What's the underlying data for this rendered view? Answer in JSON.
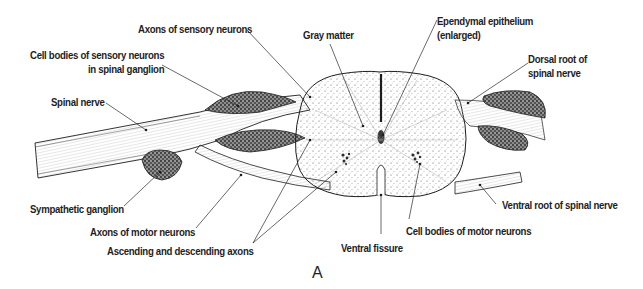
{
  "figure": {
    "panel_letter": "A",
    "colors": {
      "ink": "#1e1e1e",
      "stipple": "#555555",
      "ganglion_fill": "#6a6a6a",
      "background": "#ffffff"
    }
  },
  "labels": [
    {
      "id": "axons-sensory",
      "lines": [
        "Axons of sensory neurons"
      ],
      "x": 138,
      "y": 22,
      "align": "left",
      "leader": [
        [
          247,
          30
        ],
        [
          310,
          97
        ]
      ]
    },
    {
      "id": "cell-bodies-sensory",
      "lines": [
        "Cell bodies of sensory neurons",
        "in spinal ganglion"
      ],
      "x": 30,
      "y": 48,
      "align": "left",
      "leader": [
        [
          162,
          65
        ],
        [
          238,
          106
        ]
      ]
    },
    {
      "id": "spinal-nerve",
      "lines": [
        "Spinal nerve"
      ],
      "x": 51,
      "y": 95,
      "align": "left",
      "leader": [
        [
          106,
          103
        ],
        [
          146,
          130
        ]
      ]
    },
    {
      "id": "gray-matter",
      "lines": [
        "Gray matter"
      ],
      "x": 303,
      "y": 28,
      "align": "left",
      "leader": [
        [
          330,
          44
        ],
        [
          363,
          126
        ]
      ]
    },
    {
      "id": "ependymal-epithelium",
      "lines": [
        "Ependymal epithelium",
        "(enlarged)"
      ],
      "x": 437,
      "y": 14,
      "align": "left",
      "leader": [
        [
          437,
          20
        ],
        [
          383,
          135
        ]
      ]
    },
    {
      "id": "dorsal-root",
      "lines": [
        "Dorsal root of",
        "spinal nerve"
      ],
      "x": 528,
      "y": 52,
      "align": "left",
      "leader": [
        [
          528,
          63
        ],
        [
          468,
          103
        ]
      ]
    },
    {
      "id": "sympathetic-ganglion",
      "lines": [
        "Sympathetic ganglion"
      ],
      "x": 30,
      "y": 202,
      "align": "left",
      "leader": [
        [
          124,
          206
        ],
        [
          160,
          172
        ]
      ]
    },
    {
      "id": "axons-motor",
      "lines": [
        "Axons of motor neurons"
      ],
      "x": 90,
      "y": 225,
      "align": "left",
      "leader": [
        [
          196,
          228
        ],
        [
          241,
          175
        ]
      ]
    },
    {
      "id": "ascending-descending",
      "lines": [
        "Ascending and descending axons"
      ],
      "x": 107,
      "y": 244,
      "align": "left",
      "leaders": [
        [
          [
            253,
            243
          ],
          [
            310,
            140
          ]
        ],
        [
          [
            253,
            243
          ],
          [
            336,
            172
          ]
        ]
      ]
    },
    {
      "id": "ventral-fissure",
      "lines": [
        "Ventral fissure"
      ],
      "x": 341,
      "y": 241,
      "align": "left",
      "leader": [
        [
          381,
          234
        ],
        [
          381,
          195
        ]
      ]
    },
    {
      "id": "cell-bodies-motor",
      "lines": [
        "Cell bodies of motor neurons"
      ],
      "x": 406,
      "y": 224,
      "align": "left",
      "leader": [
        [
          409,
          219
        ],
        [
          420,
          164
        ]
      ]
    },
    {
      "id": "ventral-root",
      "lines": [
        "Ventral root of spinal nerve"
      ],
      "x": 502,
      "y": 198,
      "align": "left",
      "leader": [
        [
          496,
          204
        ],
        [
          480,
          185
        ]
      ]
    }
  ]
}
